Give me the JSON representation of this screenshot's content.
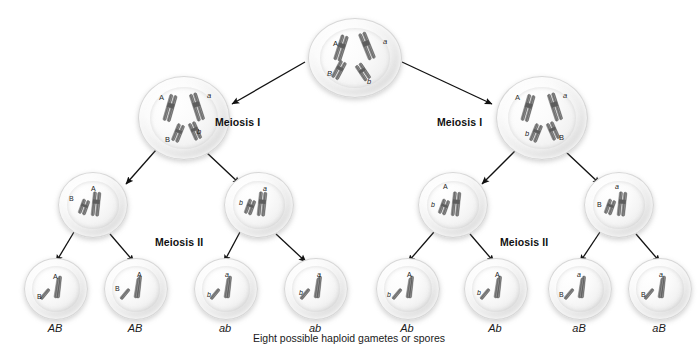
{
  "diagram": {
    "caption": "Eight possible haploid gametes or spores",
    "background_color": "#ffffff",
    "chromosome_color": "#6e6e6e",
    "label_color": "#1a1a1a"
  },
  "stage_labels": [
    {
      "id": "meiosis-1-left",
      "text": "Meiosis I",
      "x": 215,
      "y": 116
    },
    {
      "id": "meiosis-1-right",
      "text": "Meiosis I",
      "x": 437,
      "y": 116
    },
    {
      "id": "meiosis-2-left",
      "text": "Meiosis II",
      "x": 155,
      "y": 236
    },
    {
      "id": "meiosis-2-right",
      "text": "Meiosis II",
      "x": 500,
      "y": 236
    }
  ],
  "cells": {
    "parent": {
      "id": "parent-cell",
      "x": 308,
      "y": 18,
      "w": 92,
      "h": 78,
      "alleles": [
        {
          "text": "A",
          "x": 24,
          "y": 20,
          "italic": false
        },
        {
          "text": "a",
          "x": 74,
          "y": 18,
          "italic": true
        },
        {
          "text": "B",
          "x": 18,
          "y": 50,
          "italic": true
        },
        {
          "text": "b",
          "x": 58,
          "y": 58,
          "italic": true
        }
      ]
    },
    "meiosis_one": [
      {
        "id": "meiosis1-cell-left",
        "x": 138,
        "y": 76,
        "w": 90,
        "h": 82,
        "alleles": [
          {
            "text": "A",
            "x": 20,
            "y": 16,
            "italic": false
          },
          {
            "text": "a",
            "x": 68,
            "y": 14,
            "italic": true
          },
          {
            "text": "B",
            "x": 26,
            "y": 58,
            "italic": false
          },
          {
            "text": "b",
            "x": 58,
            "y": 50,
            "italic": true
          }
        ]
      },
      {
        "id": "meiosis1-cell-right",
        "x": 496,
        "y": 76,
        "w": 90,
        "h": 82,
        "alleles": [
          {
            "text": "A",
            "x": 18,
            "y": 16,
            "italic": false
          },
          {
            "text": "a",
            "x": 66,
            "y": 14,
            "italic": true
          },
          {
            "text": "b",
            "x": 28,
            "y": 52,
            "italic": true
          },
          {
            "text": "B",
            "x": 62,
            "y": 56,
            "italic": false
          }
        ]
      }
    ],
    "meiosis_two": [
      {
        "id": "meiosis2-cell-1",
        "x": 58,
        "y": 172,
        "w": 68,
        "h": 64,
        "alleles": [
          {
            "text": "B",
            "x": 10,
            "y": 22,
            "italic": false
          },
          {
            "text": "A",
            "x": 32,
            "y": 12,
            "italic": false
          }
        ]
      },
      {
        "id": "meiosis2-cell-2",
        "x": 224,
        "y": 172,
        "w": 68,
        "h": 64,
        "alleles": [
          {
            "text": "a",
            "x": 38,
            "y": 12,
            "italic": true
          },
          {
            "text": "b",
            "x": 14,
            "y": 26,
            "italic": true
          }
        ]
      },
      {
        "id": "meiosis2-cell-3",
        "x": 418,
        "y": 172,
        "w": 68,
        "h": 64,
        "alleles": [
          {
            "text": "A",
            "x": 24,
            "y": 10,
            "italic": false
          },
          {
            "text": "b",
            "x": 12,
            "y": 28,
            "italic": true
          }
        ]
      },
      {
        "id": "meiosis2-cell-4",
        "x": 584,
        "y": 172,
        "w": 68,
        "h": 64,
        "alleles": [
          {
            "text": "a",
            "x": 30,
            "y": 10,
            "italic": true
          },
          {
            "text": "B",
            "x": 12,
            "y": 28,
            "italic": false
          }
        ]
      }
    ],
    "gametes": [
      {
        "id": "gamete-1",
        "label": "AB",
        "x": 24,
        "y": 258,
        "w": 62,
        "h": 60,
        "alleles": [
          {
            "text": "A",
            "x": 28,
            "y": 14,
            "italic": false
          },
          {
            "text": "B",
            "x": 12,
            "y": 34,
            "italic": false
          }
        ]
      },
      {
        "id": "gamete-2",
        "label": "AB",
        "x": 104,
        "y": 258,
        "w": 62,
        "h": 60,
        "alleles": [
          {
            "text": "A",
            "x": 32,
            "y": 12,
            "italic": false
          },
          {
            "text": "B",
            "x": 10,
            "y": 26,
            "italic": false
          }
        ]
      },
      {
        "id": "gamete-3",
        "label": "ab",
        "x": 194,
        "y": 258,
        "w": 62,
        "h": 60,
        "alleles": [
          {
            "text": "a",
            "x": 30,
            "y": 12,
            "italic": true
          },
          {
            "text": "b",
            "x": 12,
            "y": 32,
            "italic": true
          }
        ]
      },
      {
        "id": "gamete-4",
        "label": "ab",
        "x": 284,
        "y": 258,
        "w": 62,
        "h": 60,
        "alleles": [
          {
            "text": "a",
            "x": 32,
            "y": 12,
            "italic": true
          },
          {
            "text": "b",
            "x": 14,
            "y": 30,
            "italic": true
          }
        ]
      },
      {
        "id": "gamete-5",
        "label": "Ab",
        "x": 376,
        "y": 258,
        "w": 62,
        "h": 60,
        "alleles": [
          {
            "text": "A",
            "x": 30,
            "y": 12,
            "italic": false
          },
          {
            "text": "b",
            "x": 10,
            "y": 32,
            "italic": true
          }
        ]
      },
      {
        "id": "gamete-6",
        "label": "Ab",
        "x": 464,
        "y": 258,
        "w": 62,
        "h": 60,
        "alleles": [
          {
            "text": "A",
            "x": 30,
            "y": 12,
            "italic": false
          },
          {
            "text": "b",
            "x": 12,
            "y": 30,
            "italic": true
          }
        ]
      },
      {
        "id": "gamete-7",
        "label": "aB",
        "x": 548,
        "y": 258,
        "w": 62,
        "h": 60,
        "alleles": [
          {
            "text": "a",
            "x": 28,
            "y": 12,
            "italic": true
          },
          {
            "text": "B",
            "x": 10,
            "y": 32,
            "italic": false
          }
        ]
      },
      {
        "id": "gamete-8",
        "label": "aB",
        "x": 628,
        "y": 258,
        "w": 62,
        "h": 60,
        "alleles": [
          {
            "text": "a",
            "x": 30,
            "y": 12,
            "italic": true
          },
          {
            "text": "B",
            "x": 12,
            "y": 32,
            "italic": false
          }
        ]
      }
    ]
  },
  "arrows": [
    {
      "id": "arrow-parent-to-left",
      "x1": 305,
      "y1": 62,
      "x2": 232,
      "y2": 104
    },
    {
      "id": "arrow-parent-to-right",
      "x1": 402,
      "y1": 62,
      "x2": 492,
      "y2": 104
    },
    {
      "id": "arrow-m1l-to-g1",
      "x1": 156,
      "y1": 150,
      "x2": 126,
      "y2": 184
    },
    {
      "id": "arrow-m1l-to-g2",
      "x1": 206,
      "y1": 152,
      "x2": 240,
      "y2": 184
    },
    {
      "id": "arrow-m1r-to-g3",
      "x1": 516,
      "y1": 150,
      "x2": 482,
      "y2": 184
    },
    {
      "id": "arrow-m1r-to-g4",
      "x1": 566,
      "y1": 152,
      "x2": 600,
      "y2": 184
    },
    {
      "id": "arrow-m2c1-to-gam1",
      "x1": 74,
      "y1": 232,
      "x2": 56,
      "y2": 262
    },
    {
      "id": "arrow-m2c1-to-gam2",
      "x1": 110,
      "y1": 234,
      "x2": 134,
      "y2": 262
    },
    {
      "id": "arrow-m2c2-to-gam3",
      "x1": 240,
      "y1": 232,
      "x2": 224,
      "y2": 262
    },
    {
      "id": "arrow-m2c2-to-gam4",
      "x1": 276,
      "y1": 234,
      "x2": 306,
      "y2": 262
    },
    {
      "id": "arrow-m2c3-to-gam5",
      "x1": 434,
      "y1": 232,
      "x2": 408,
      "y2": 262
    },
    {
      "id": "arrow-m2c3-to-gam6",
      "x1": 470,
      "y1": 234,
      "x2": 494,
      "y2": 262
    },
    {
      "id": "arrow-m2c4-to-gam7",
      "x1": 600,
      "y1": 232,
      "x2": 580,
      "y2": 262
    },
    {
      "id": "arrow-m2c4-to-gam8",
      "x1": 636,
      "y1": 234,
      "x2": 660,
      "y2": 262
    }
  ],
  "caption_pos": {
    "x": 359,
    "y": 340
  }
}
